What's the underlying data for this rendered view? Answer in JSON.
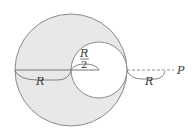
{
  "diagram": {
    "colors": {
      "fill": "#e8e8e8",
      "stroke": "#8a8a8a",
      "text": "#333333"
    },
    "labels": {
      "big_radius": "R",
      "cavity_radius_num": "R",
      "cavity_radius_den": "2",
      "distance": "R",
      "point": "P"
    }
  }
}
